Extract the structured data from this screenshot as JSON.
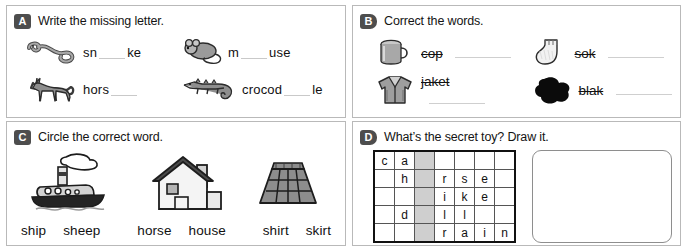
{
  "worksheet": {
    "panels": [
      {
        "id": "a",
        "badge": "A",
        "prompt": "Write the missing letter.",
        "items": [
          {
            "icon": "snake-icon",
            "before": "sn",
            "after": "ke"
          },
          {
            "icon": "mouse-icon",
            "before": "m",
            "after": "use"
          },
          {
            "icon": "horse-icon",
            "before": "hors",
            "after": ""
          },
          {
            "icon": "crocodile-icon",
            "before": "crocod",
            "after": "le"
          }
        ]
      },
      {
        "id": "b",
        "badge": "B",
        "prompt": "Correct the words.",
        "items": [
          {
            "icon": "mug-icon",
            "wrong_word": "cop"
          },
          {
            "icon": "sock-icon",
            "wrong_word": "sok"
          },
          {
            "icon": "jacket-icon",
            "wrong_word": "jaket"
          },
          {
            "icon": "blot-icon",
            "wrong_word": "blak"
          }
        ]
      },
      {
        "id": "c",
        "badge": "C",
        "prompt": "Circle the correct word.",
        "figures": [
          "ship-icon",
          "house-icon",
          "skirt-icon"
        ],
        "choices": [
          [
            "ship",
            "sheep"
          ],
          [
            "horse",
            "house"
          ],
          [
            "shirt",
            "skirt"
          ]
        ]
      },
      {
        "id": "d",
        "badge": "D",
        "prompt": "What’s the secret toy? Draw it.",
        "grid": {
          "columns": 7,
          "rows": 5,
          "shaded_column_index": 2,
          "cells": [
            [
              "c",
              "a",
              "",
              "",
              "",
              "",
              ""
            ],
            [
              "",
              "h",
              "",
              "r",
              "s",
              "e",
              ""
            ],
            [
              "",
              "",
              "",
              "i",
              "k",
              "e",
              ""
            ],
            [
              "",
              "d",
              "",
              "l",
              "l",
              "",
              ""
            ],
            [
              "",
              "",
              "",
              "r",
              "a",
              "i",
              "n"
            ]
          ]
        },
        "draw_area_label": "drawing-box"
      }
    ]
  },
  "colors": {
    "badge_bg": "#4d4d4d",
    "panel_border": "#b9b9b9",
    "grid_shade": "#cfcfcf",
    "text": "#111111"
  }
}
